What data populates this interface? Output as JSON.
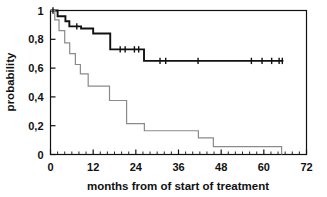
{
  "chart_data": {
    "type": "line",
    "title": "",
    "subtitle": "",
    "xlabel": "months from of start of treatment",
    "ylabel": "probability",
    "xlim": [
      0,
      72
    ],
    "ylim": [
      0,
      1
    ],
    "grid": false,
    "legend": "none",
    "x_ticks": [
      0,
      12,
      24,
      36,
      48,
      60,
      72
    ],
    "x_tick_labels": [
      "0",
      "12",
      "24",
      "36",
      "48",
      "60",
      "72"
    ],
    "x_minor_tick_interval": 2,
    "y_ticks": [
      0,
      0.2,
      0.4,
      0.6,
      0.8,
      1
    ],
    "y_tick_labels": [
      "0",
      "0,2",
      "0,4",
      "0,6",
      "0,8",
      "1"
    ],
    "decimal_separator": ",",
    "series": [
      {
        "name": "upper-curve",
        "style": "step",
        "color": "#111111",
        "line_width": 1.9,
        "points": [
          [
            0,
            1.0
          ],
          [
            2.0,
            1.0
          ],
          [
            2.0,
            0.96
          ],
          [
            4.2,
            0.96
          ],
          [
            4.2,
            0.925
          ],
          [
            5.3,
            0.925
          ],
          [
            5.3,
            0.89
          ],
          [
            8.6,
            0.89
          ],
          [
            8.6,
            0.875
          ],
          [
            12.0,
            0.875
          ],
          [
            12.0,
            0.84
          ],
          [
            16.8,
            0.84
          ],
          [
            16.8,
            0.73
          ],
          [
            26.3,
            0.73
          ],
          [
            26.3,
            0.65
          ],
          [
            65.5,
            0.65
          ]
        ],
        "censor_marks": [
          [
            0.7,
            1.0
          ],
          [
            7.4,
            0.89
          ],
          [
            19.6,
            0.73
          ],
          [
            21.0,
            0.73
          ],
          [
            23.6,
            0.73
          ],
          [
            24.8,
            0.73
          ],
          [
            30.8,
            0.65
          ],
          [
            32.4,
            0.65
          ],
          [
            41.5,
            0.65
          ],
          [
            56.5,
            0.65
          ],
          [
            59.5,
            0.65
          ],
          [
            62.2,
            0.65
          ],
          [
            64.3,
            0.65
          ],
          [
            65.2,
            0.65
          ]
        ]
      },
      {
        "name": "lower-curve",
        "style": "step",
        "color": "#8a8a8a",
        "line_width": 1.2,
        "points": [
          [
            0,
            1.0
          ],
          [
            1.2,
            1.0
          ],
          [
            1.2,
            0.935
          ],
          [
            2.4,
            0.935
          ],
          [
            2.4,
            0.86
          ],
          [
            4.0,
            0.86
          ],
          [
            4.0,
            0.775
          ],
          [
            5.4,
            0.775
          ],
          [
            5.4,
            0.7
          ],
          [
            7.0,
            0.7
          ],
          [
            7.0,
            0.625
          ],
          [
            8.4,
            0.625
          ],
          [
            8.4,
            0.56
          ],
          [
            10.6,
            0.56
          ],
          [
            10.6,
            0.475
          ],
          [
            16.6,
            0.475
          ],
          [
            16.6,
            0.375
          ],
          [
            21.4,
            0.375
          ],
          [
            21.4,
            0.215
          ],
          [
            26.4,
            0.215
          ],
          [
            26.4,
            0.165
          ],
          [
            41.6,
            0.165
          ],
          [
            41.6,
            0.115
          ],
          [
            45.8,
            0.115
          ],
          [
            45.8,
            0.055
          ],
          [
            65.0,
            0.055
          ],
          [
            65.0,
            0.0
          ]
        ],
        "censor_marks": []
      }
    ]
  },
  "figure": {
    "frame_color": "#111111",
    "background": "#ffffff"
  }
}
